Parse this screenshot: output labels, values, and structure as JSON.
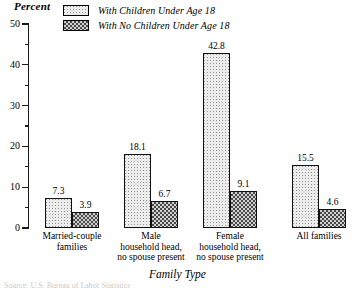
{
  "chart_data": {
    "type": "bar",
    "title": "",
    "xlabel": "Family Type",
    "ylabel": "Percent",
    "ylim": [
      0,
      50
    ],
    "ytick_step": 10,
    "yticks": [
      0,
      10,
      20,
      30,
      40,
      50
    ],
    "ytick_labels": [
      "0",
      "10",
      "20",
      "30",
      "40",
      "50"
    ],
    "minor_ticks": [
      5,
      15,
      25,
      35,
      45
    ],
    "grid": false,
    "legend_position": "top",
    "categories": [
      "Married-couple\nfamilies",
      "Male\nhousehold head,\nno spouse present",
      "Female\nhousehold head,\nno spouse present",
      "All families"
    ],
    "series": [
      {
        "name": "With Children Under Age 18",
        "values": [
          7.3,
          18.1,
          42.8,
          15.5
        ],
        "value_labels": [
          "7.3",
          "18.1",
          "42.8",
          "15.5"
        ],
        "fill": "light-stipple"
      },
      {
        "name": "With No Children Under Age 18",
        "values": [
          3.9,
          6.7,
          9.1,
          4.6
        ],
        "value_labels": [
          "3.9",
          "6.7",
          "9.1",
          "4.6"
        ],
        "fill": "dark-checker"
      }
    ],
    "colors": {
      "axis": "#1a1a1a",
      "bar_outline": "#111111",
      "series_light_fill": "#ececec",
      "series_light_dots": "#9a9a9a",
      "series_dark_fill": "#cfcfcf",
      "series_dark_hatch": "#4a4a4a",
      "background": "#ffffff"
    }
  },
  "legend": {
    "items": [
      {
        "label": "With Children Under Age 18",
        "swatch": "light-stipple"
      },
      {
        "label": "With No Children Under Age 18",
        "swatch": "dark-checker"
      }
    ]
  },
  "footer": {
    "source_note": "Source: U.S. Bureau of Labor Statistics"
  }
}
